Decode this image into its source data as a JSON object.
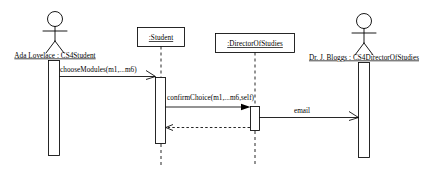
{
  "diagram": {
    "type": "uml-sequence-diagram",
    "title": "",
    "background_color": "#ffffff",
    "line_color": "#000000",
    "participants": [
      {
        "id": "ada",
        "kind": "actor",
        "label": "Ada Lovelace : CS4Student",
        "underlined": true,
        "center_x": 55,
        "label_y": 57,
        "activation": {
          "x": 48,
          "y": 60,
          "width": 11,
          "height": 96
        }
      },
      {
        "id": "student",
        "kind": "object",
        "label": ":Student",
        "underlined": true,
        "center_x": 160,
        "box": {
          "x": 137,
          "y": 27,
          "width": 48,
          "height": 20
        },
        "lifeline": {
          "top": 47,
          "bottom": 165
        },
        "activation": {
          "x": 155,
          "y": 77,
          "width": 10,
          "height": 67
        }
      },
      {
        "id": "director",
        "kind": "object",
        "label": ":DirectorOfStudies",
        "underlined": true,
        "center_x": 255,
        "box": {
          "x": 215,
          "y": 33,
          "width": 80,
          "height": 20
        },
        "lifeline": {
          "top": 53,
          "bottom": 165
        },
        "activation": {
          "x": 250,
          "y": 106,
          "width": 10,
          "height": 25
        }
      },
      {
        "id": "bloggs",
        "kind": "actor",
        "label": "Dr. J. Bloggs : CS4DirectorOfStudies",
        "underlined": true,
        "center_x": 364,
        "label_y": 59,
        "activation": {
          "x": 358,
          "y": 62,
          "width": 11,
          "height": 96
        }
      }
    ],
    "messages": [
      {
        "id": "msg-choose-modules",
        "label": "chooseModules(m1,...m6)",
        "from": "ada",
        "to": "student",
        "style": "solid",
        "arrow": "open",
        "direction": "right",
        "y": 76,
        "label_x": 60,
        "label_y": 72
      },
      {
        "id": "msg-confirm-choice",
        "label": "confirmChoice(m1,...m6,self)",
        "from": "student",
        "to": "director",
        "style": "solid",
        "arrow": "filled",
        "direction": "right",
        "y": 107,
        "label_x": 167,
        "label_y": 100
      },
      {
        "id": "msg-email",
        "label": "email",
        "from": "director",
        "to": "bloggs",
        "style": "solid",
        "arrow": "open",
        "direction": "right",
        "y": 117,
        "label_x": 302,
        "label_y": 113
      },
      {
        "id": "msg-return-confirm",
        "label": "",
        "from": "director",
        "to": "student",
        "style": "dashed",
        "arrow": "open",
        "direction": "left",
        "y": 127,
        "label_x": 0,
        "label_y": 0
      }
    ]
  }
}
